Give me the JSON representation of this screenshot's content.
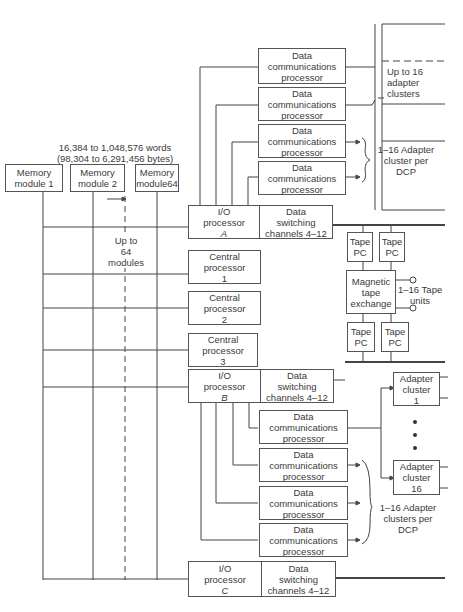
{
  "memory": {
    "capacity_line1": "16,384 to 1,048,576 words",
    "capacity_line2": "(98,304 to 6,291,456 bytes)",
    "modules": [
      {
        "line1": "Memory",
        "line2": "module 1"
      },
      {
        "line1": "Memory",
        "line2": "module 2"
      },
      {
        "line1": "Memory",
        "line2": "module64"
      }
    ],
    "up_to_line1": "Up to",
    "up_to_line2": "64",
    "up_to_line3": "modules"
  },
  "central_processors": [
    {
      "line1": "Central",
      "line2": "processor",
      "line3": "1"
    },
    {
      "line1": "Central",
      "line2": "processor",
      "line3": "2"
    },
    {
      "line1": "Central",
      "line2": "processor",
      "line3": "3"
    }
  ],
  "io_processors": [
    {
      "line1": "I/O",
      "line2": "processor",
      "id": "A"
    },
    {
      "line1": "I/O",
      "line2": "processor",
      "id": "B"
    },
    {
      "line1": "I/O",
      "line2": "processor",
      "id": "C"
    }
  ],
  "data_switching": {
    "line1": "Data",
    "line2": "switching",
    "line3": "channels 4–12"
  },
  "dcp": {
    "line1": "Data",
    "line2": "communications",
    "line3": "processor"
  },
  "annotations": {
    "up_to_16_line1": "Up to 16",
    "up_to_16_line2": "adapter",
    "up_to_16_line3": "clusters",
    "adapter_per_dcp_a_line1": "1–16 Adapter",
    "adapter_per_dcp_a_line2": "cluster per",
    "adapter_per_dcp_a_line3": "DCP",
    "adapter_per_dcp_b_line1": "1–16 Adapter",
    "adapter_per_dcp_b_line2": "clusters per",
    "adapter_per_dcp_b_line3": "DCP",
    "tape_units_line1": "1–16 Tape",
    "tape_units_line2": "units"
  },
  "tape": {
    "pc_line1": "Tape",
    "pc_line2": "PC",
    "exchange_line1": "Magnetic",
    "exchange_line2": "tape",
    "exchange_line3": "exchange"
  },
  "adapter_clusters": [
    {
      "line1": "Adapter",
      "line2": "cluster",
      "line3": "1"
    },
    {
      "line1": "Adapter",
      "line2": "cluster",
      "line3": "16"
    }
  ]
}
